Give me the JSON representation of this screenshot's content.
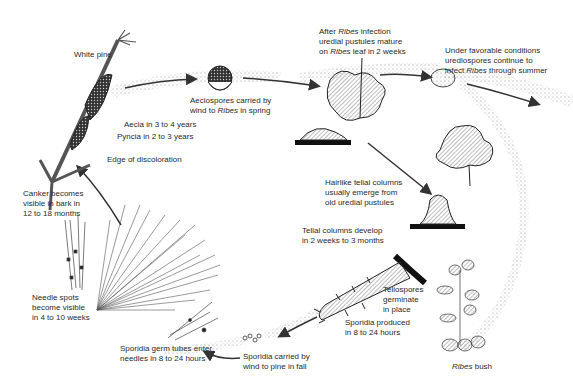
{
  "diagram": {
    "labels": {
      "white_pine": "White pine",
      "aecia": "Aecia in 3 to 4 years",
      "pyncia": "Pyncia in 2 to 3 years",
      "edge": "Edge of discoloration",
      "aeciospores_1": "Aeciospores carried by",
      "aeciospores_2a": "wind to ",
      "aeciospores_2b": "Ribes",
      "aeciospores_2c": " in spring",
      "ribes_infection_1a": "After ",
      "ribes_infection_1b": "Ribes",
      "ribes_infection_1c": " infection",
      "ribes_infection_2": "uredial pustules mature",
      "ribes_infection_3a": "on ",
      "ribes_infection_3b": "Ribes",
      "ribes_infection_3c": " leaf in 2 weeks",
      "favorable_1": "Under favorable conditions",
      "favorable_2": "urediospores continue to",
      "favorable_3a": "infect ",
      "favorable_3b": "Ribes",
      "favorable_3c": " through summer",
      "hairlike_1": "Hairlike telial columns",
      "hairlike_2": "usually emerge from",
      "hairlike_3": "old uredial pustules",
      "telial_1": "Telial columns develop",
      "telial_2": "in 2 weeks to 3 months",
      "teliospores_1": "Teliospores",
      "teliospores_2": "germinate",
      "teliospores_3": "in place",
      "sporidia_prod_1": "Sporidia produced",
      "sporidia_prod_2": "in 8 to 24 hours",
      "sporidia_wind_1": "Sporidia carried by",
      "sporidia_wind_2": "wind to pine in fall",
      "germ_1": "Sporidia germ tubes enter",
      "germ_2": "needles in 8 to 24 hours",
      "needle_1": "Needle spots",
      "needle_2": "become visible",
      "needle_3": "in 4 to 10 weeks",
      "canker_1": "Canker becomes",
      "canker_2": "visible in bark in",
      "canker_3": "12 to 18 months",
      "ribes_bush_a": "Ribes",
      "ribes_bush_b": " bush"
    }
  }
}
